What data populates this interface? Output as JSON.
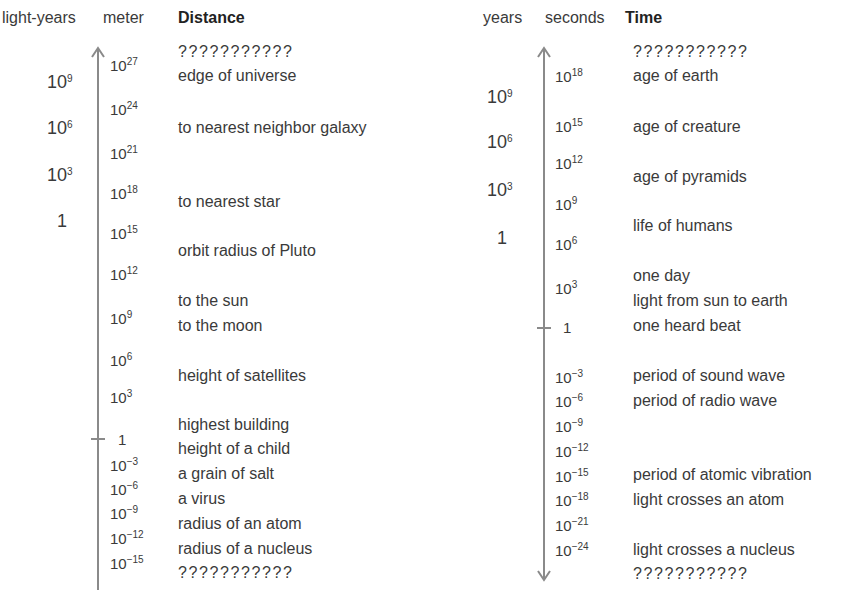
{
  "distance": {
    "headers": {
      "col1": "light-years",
      "col2": "meter",
      "col3": "Distance"
    },
    "light_years": [
      {
        "base": "10",
        "exp": "9"
      },
      {
        "base": "10",
        "exp": "6"
      },
      {
        "base": "10",
        "exp": "3"
      },
      {
        "base": "1",
        "exp": ""
      }
    ],
    "meters": [
      {
        "base": "10",
        "exp": "27"
      },
      {
        "base": "10",
        "exp": "24"
      },
      {
        "base": "10",
        "exp": "21"
      },
      {
        "base": "10",
        "exp": "18"
      },
      {
        "base": "10",
        "exp": "15"
      },
      {
        "base": "10",
        "exp": "12"
      },
      {
        "base": "10",
        "exp": "9"
      },
      {
        "base": "10",
        "exp": "6"
      },
      {
        "base": "10",
        "exp": "3"
      },
      {
        "base": "1",
        "exp": ""
      },
      {
        "base": "10",
        "exp": "−3"
      },
      {
        "base": "10",
        "exp": "−6"
      },
      {
        "base": "10",
        "exp": "−9"
      },
      {
        "base": "10",
        "exp": "−12"
      },
      {
        "base": "10",
        "exp": "−15"
      }
    ],
    "labels": [
      "???????????",
      "edge of universe",
      "to nearest neighbor galaxy",
      "to nearest star",
      "orbit radius of Pluto",
      "to the sun",
      "to the moon",
      "height of satellites",
      "highest building",
      "height of a child",
      "a grain of salt",
      "a virus",
      "radius of an atom",
      "radius of a nucleus",
      "???????????"
    ]
  },
  "time": {
    "headers": {
      "col1": "years",
      "col2": "seconds",
      "col3": "Time"
    },
    "years": [
      {
        "base": "10",
        "exp": "9"
      },
      {
        "base": "10",
        "exp": "6"
      },
      {
        "base": "10",
        "exp": "3"
      },
      {
        "base": "1",
        "exp": ""
      }
    ],
    "seconds": [
      {
        "base": "10",
        "exp": "18"
      },
      {
        "base": "10",
        "exp": "15"
      },
      {
        "base": "10",
        "exp": "12"
      },
      {
        "base": "10",
        "exp": "9"
      },
      {
        "base": "10",
        "exp": "6"
      },
      {
        "base": "10",
        "exp": "3"
      },
      {
        "base": "1",
        "exp": ""
      },
      {
        "base": "10",
        "exp": "−3"
      },
      {
        "base": "10",
        "exp": "−6"
      },
      {
        "base": "10",
        "exp": "−9"
      },
      {
        "base": "10",
        "exp": "−12"
      },
      {
        "base": "10",
        "exp": "−15"
      },
      {
        "base": "10",
        "exp": "−18"
      },
      {
        "base": "10",
        "exp": "−21"
      },
      {
        "base": "10",
        "exp": "−24"
      }
    ],
    "labels": [
      "???????????",
      "age of earth",
      "age of creature",
      "age of pyramids",
      "life of humans",
      "one day",
      "light from sun to earth",
      "one heard beat",
      "period of sound wave",
      "period of radio wave",
      "period of atomic vibration",
      "light crosses an atom",
      "light crosses a nucleus",
      "???????????"
    ]
  },
  "colors": {
    "axis": "#8a8a8a",
    "text": "#3a3a3a"
  }
}
